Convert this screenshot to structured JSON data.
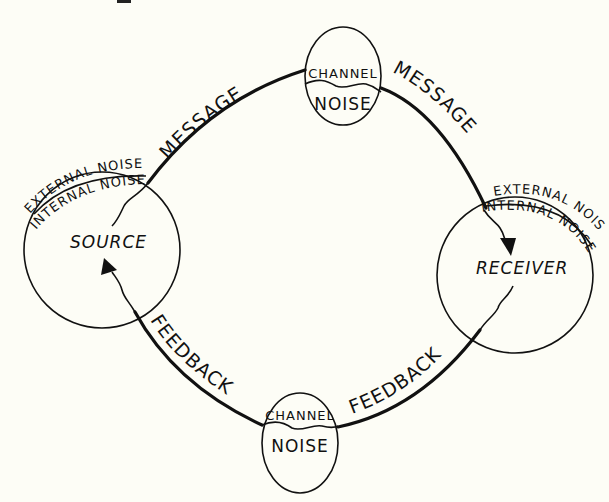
{
  "diagram": {
    "type": "communication-model",
    "nodes": {
      "source": {
        "label": "SOURCE",
        "outer_label": "EXTERNAL NOISE",
        "inner_label": "INTERNAL NOISE"
      },
      "receiver": {
        "label": "RECEIVER",
        "outer_label": "EXTERNAL NOISE",
        "inner_label": "INTERNAL NOISE"
      },
      "channel_top": {
        "upper_label": "CHANNEL",
        "lower_label": "NOISE"
      },
      "channel_bottom": {
        "upper_label": "CHANNEL",
        "lower_label": "NOISE"
      }
    },
    "edges": {
      "message_left": {
        "label": "MESSAGE",
        "from": "source",
        "to": "channel_top"
      },
      "message_right": {
        "label": "MESSAGE",
        "from": "channel_top",
        "to": "receiver"
      },
      "feedback_right": {
        "label": "FEEDBACK",
        "from": "receiver",
        "to": "channel_bottom"
      },
      "feedback_left": {
        "label": "FEEDBACK",
        "from": "channel_bottom",
        "to": "source"
      }
    },
    "colors": {
      "ink": "#111111",
      "paper": "#fdfdf6"
    }
  }
}
